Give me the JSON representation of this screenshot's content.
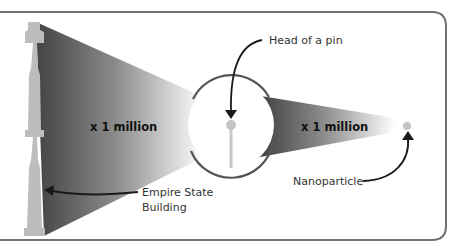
{
  "diagram": {
    "labels": {
      "scale_left": "x 1 million",
      "scale_right": "x 1 million",
      "pin": "Head of a pin",
      "nanoparticle": "Nanoparticle",
      "building_line1": "Empire State",
      "building_line2": "Building"
    },
    "colors": {
      "frame": "#6e6e6e",
      "cone_dark": "#4a4a4a",
      "cone_light": "#ffffff",
      "building": "#bdbdbd",
      "pin": "#c4c4c4",
      "arrow": "#1a1a1a",
      "text": "#333333"
    }
  }
}
